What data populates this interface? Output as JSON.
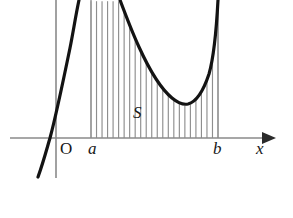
{
  "figure": {
    "width": 293,
    "height": 218,
    "background_color": "#ffffff"
  },
  "axes": {
    "x_axis": {
      "label": "x",
      "label_x": 256,
      "label_y": 140,
      "y_position": 138,
      "x_start": 10,
      "x_end": 266,
      "color": "#8a8a8a",
      "arrow": {
        "name": "x-axis-arrowhead",
        "color": "#2b2b2b",
        "tip_x": 276,
        "half_height": 6,
        "length": 14
      }
    },
    "y_axis": {
      "label": "O",
      "label_x": 60,
      "label_y": 140,
      "x_position": 56,
      "y_start": 0,
      "y_end": 178,
      "color": "#9a9a9a"
    }
  },
  "region": {
    "label": "S",
    "label_x": 133,
    "label_y": 104,
    "lower_bound": {
      "label": "a",
      "x": 91,
      "label_x": 88,
      "label_y": 140
    },
    "upper_bound": {
      "label": "b",
      "x": 218,
      "label_x": 213,
      "label_y": 140
    },
    "hatch_line_count": 23,
    "hatch_color": "#8e8e8e"
  },
  "curve": {
    "name": "cubic-function-curve",
    "color": "#131313",
    "stroke_width": 3.2,
    "x_axis_crossing": 50,
    "local_minimum": {
      "x": 185,
      "y": 103
    },
    "enters_bottom_left": {
      "x": 38,
      "y": 177
    },
    "exits_top_ascending": {
      "x": 78,
      "y": 0
    },
    "enters_top_descending": {
      "x": 120,
      "y": 0
    },
    "exits_top_right": {
      "x": 218,
      "y": 0
    },
    "path": "M 38,177 C 44,160 47,148 50,138 C 56,116 63,82 70,48 C 73,33 76,14 79,0 M 120,0 C 126,16 132,32 139,47 C 149,69 160,88 172,98 C 178,103 183,105 188,104 C 196,102 203,92 209,74 C 213,60 216,38 218,0"
  },
  "chart_data": {
    "type": "line",
    "xlabel": "x",
    "ylabel": "",
    "grid": false,
    "legend": null,
    "annotations": [
      {
        "text": "O",
        "role": "origin-label"
      },
      {
        "text": "a",
        "role": "lower-limit-label"
      },
      {
        "text": "b",
        "role": "upper-limit-label"
      },
      {
        "text": "S",
        "role": "shaded-area-label"
      },
      {
        "text": "x",
        "role": "axis-label"
      }
    ],
    "shaded_region": {
      "from": "a",
      "to": "b",
      "label": "S",
      "fill": "vertical-hatching"
    }
  }
}
